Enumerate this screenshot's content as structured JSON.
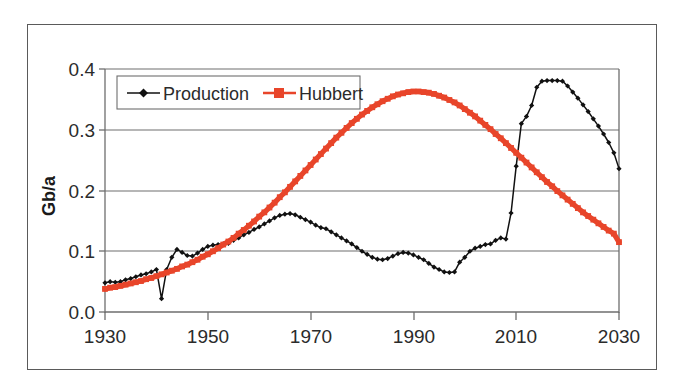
{
  "chart_data": {
    "type": "line",
    "title": "",
    "xlabel": "",
    "ylabel": "Gb/a",
    "xlim": [
      1930,
      2030
    ],
    "ylim": [
      0.0,
      0.4
    ],
    "grid": true,
    "legend_position": "top-left-inside",
    "x_ticks": [
      "1930",
      "1950",
      "1970",
      "1990",
      "2010",
      "2030"
    ],
    "x_tick_values": [
      1930,
      1950,
      1970,
      1990,
      2010,
      2030
    ],
    "y_ticks": [
      "0.0",
      "0.1",
      "0.2",
      "0.3",
      "0.4"
    ],
    "y_tick_values": [
      0.0,
      0.1,
      0.2,
      0.3,
      0.4
    ],
    "series": [
      {
        "name": "Production",
        "color": "#111111",
        "marker": "diamond",
        "x": [
          1930,
          1931,
          1932,
          1933,
          1934,
          1935,
          1936,
          1937,
          1938,
          1939,
          1940,
          1941,
          1942,
          1943,
          1944,
          1945,
          1946,
          1947,
          1948,
          1949,
          1950,
          1951,
          1952,
          1953,
          1954,
          1955,
          1956,
          1957,
          1958,
          1959,
          1960,
          1961,
          1962,
          1963,
          1964,
          1965,
          1966,
          1967,
          1968,
          1969,
          1970,
          1971,
          1972,
          1973,
          1974,
          1975,
          1976,
          1977,
          1978,
          1979,
          1980,
          1981,
          1982,
          1983,
          1984,
          1985,
          1986,
          1987,
          1988,
          1989,
          1990,
          1991,
          1992,
          1993,
          1994,
          1995,
          1996,
          1997,
          1998,
          1999,
          2000,
          2001,
          2002,
          2003,
          2004,
          2005,
          2006,
          2007,
          2008,
          2009,
          2010,
          2011,
          2012,
          2013,
          2014,
          2015,
          2016,
          2017,
          2018,
          2019,
          2020,
          2021,
          2022,
          2023,
          2024,
          2025,
          2026,
          2027,
          2028,
          2029,
          2030
        ],
        "y": [
          0.048,
          0.05,
          0.049,
          0.05,
          0.053,
          0.055,
          0.058,
          0.061,
          0.063,
          0.066,
          0.07,
          0.022,
          0.07,
          0.09,
          0.103,
          0.098,
          0.093,
          0.092,
          0.097,
          0.103,
          0.108,
          0.11,
          0.111,
          0.112,
          0.113,
          0.118,
          0.122,
          0.127,
          0.131,
          0.136,
          0.14,
          0.145,
          0.15,
          0.155,
          0.159,
          0.161,
          0.162,
          0.16,
          0.156,
          0.152,
          0.148,
          0.143,
          0.139,
          0.137,
          0.132,
          0.127,
          0.122,
          0.117,
          0.112,
          0.106,
          0.1,
          0.095,
          0.09,
          0.087,
          0.086,
          0.088,
          0.092,
          0.096,
          0.098,
          0.097,
          0.094,
          0.09,
          0.086,
          0.08,
          0.074,
          0.07,
          0.066,
          0.065,
          0.066,
          0.082,
          0.09,
          0.1,
          0.105,
          0.108,
          0.111,
          0.112,
          0.118,
          0.122,
          0.12,
          0.163,
          0.24,
          0.31,
          0.322,
          0.34,
          0.37,
          0.38,
          0.381,
          0.381,
          0.381,
          0.38,
          0.372,
          0.362,
          0.352,
          0.341,
          0.33,
          0.318,
          0.306,
          0.293,
          0.279,
          0.262,
          0.236
        ]
      },
      {
        "name": "Hubbert",
        "color": "#E8452A",
        "marker": "square",
        "x": [
          1930,
          1931,
          1932,
          1933,
          1934,
          1935,
          1936,
          1937,
          1938,
          1939,
          1940,
          1941,
          1942,
          1943,
          1944,
          1945,
          1946,
          1947,
          1948,
          1949,
          1950,
          1951,
          1952,
          1953,
          1954,
          1955,
          1956,
          1957,
          1958,
          1959,
          1960,
          1961,
          1962,
          1963,
          1964,
          1965,
          1966,
          1967,
          1968,
          1969,
          1970,
          1971,
          1972,
          1973,
          1974,
          1975,
          1976,
          1977,
          1978,
          1979,
          1980,
          1981,
          1982,
          1983,
          1984,
          1985,
          1986,
          1987,
          1988,
          1989,
          1990,
          1991,
          1992,
          1993,
          1994,
          1995,
          1996,
          1997,
          1998,
          1999,
          2000,
          2001,
          2002,
          2003,
          2004,
          2005,
          2006,
          2007,
          2008,
          2009,
          2010,
          2011,
          2012,
          2013,
          2014,
          2015,
          2016,
          2017,
          2018,
          2019,
          2020,
          2021,
          2022,
          2023,
          2024,
          2025,
          2026,
          2027,
          2028,
          2029,
          2030
        ],
        "y": [
          0.038,
          0.04,
          0.041,
          0.043,
          0.045,
          0.047,
          0.049,
          0.051,
          0.054,
          0.056,
          0.059,
          0.062,
          0.065,
          0.068,
          0.071,
          0.075,
          0.078,
          0.082,
          0.086,
          0.091,
          0.095,
          0.1,
          0.105,
          0.111,
          0.116,
          0.122,
          0.129,
          0.135,
          0.142,
          0.149,
          0.157,
          0.164,
          0.172,
          0.18,
          0.189,
          0.197,
          0.206,
          0.215,
          0.224,
          0.233,
          0.242,
          0.251,
          0.26,
          0.269,
          0.278,
          0.287,
          0.295,
          0.303,
          0.311,
          0.318,
          0.325,
          0.331,
          0.337,
          0.342,
          0.347,
          0.351,
          0.355,
          0.358,
          0.36,
          0.362,
          0.363,
          0.363,
          0.362,
          0.361,
          0.359,
          0.356,
          0.353,
          0.349,
          0.345,
          0.34,
          0.334,
          0.328,
          0.322,
          0.315,
          0.308,
          0.301,
          0.293,
          0.286,
          0.278,
          0.27,
          0.262,
          0.254,
          0.246,
          0.238,
          0.23,
          0.222,
          0.214,
          0.207,
          0.199,
          0.192,
          0.185,
          0.178,
          0.171,
          0.164,
          0.158,
          0.152,
          0.146,
          0.14,
          0.134,
          0.129,
          0.115
        ]
      }
    ]
  },
  "legend": {
    "items": [
      {
        "label": "Production",
        "marker": "diamond-marker-icon",
        "color": "#111111"
      },
      {
        "label": "Hubbert",
        "marker": "square-marker-icon",
        "color": "#E8452A"
      }
    ]
  },
  "axes": {
    "y_title": "Gb/a",
    "y_tick_labels": [
      "0.4",
      "0.3",
      "0.2",
      "0.1",
      "0.0"
    ],
    "x_tick_labels": [
      "1930",
      "1950",
      "1970",
      "1990",
      "2010",
      "2030"
    ]
  },
  "colors": {
    "production": "#111111",
    "hubbert": "#E8452A",
    "axis": "#6e6e6e",
    "frame": "#5a5a5a",
    "text": "#2b2b2b",
    "background": "#ffffff"
  }
}
